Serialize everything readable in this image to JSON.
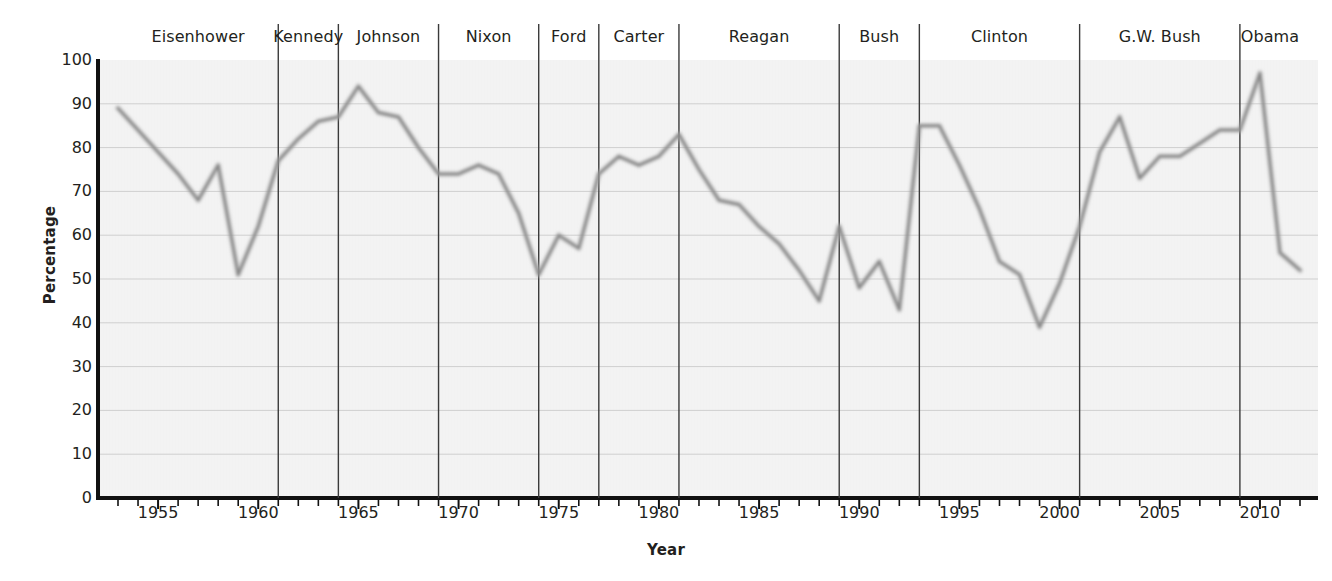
{
  "chart_data": {
    "type": "line",
    "title": "",
    "xlabel": "Year",
    "ylabel": "Percentage",
    "xlim": [
      1953,
      2012
    ],
    "ylim": [
      0,
      100
    ],
    "ytick_values": [
      0,
      10,
      20,
      30,
      40,
      50,
      60,
      70,
      80,
      90,
      100
    ],
    "ytick_labels": [
      "0",
      "10",
      "20",
      "30",
      "40",
      "50",
      "60",
      "70",
      "80",
      "90",
      "100"
    ],
    "xtick_labels": [
      "1955",
      "1960",
      "1965",
      "1970",
      "1975",
      "1980",
      "1985",
      "1990",
      "1995",
      "2000",
      "2005",
      "2010"
    ],
    "xtick_values": [
      1955,
      1960,
      1965,
      1970,
      1975,
      1980,
      1985,
      1990,
      1995,
      2000,
      2005,
      2010
    ],
    "xtick_minor_step": 1,
    "grid": "horizontal",
    "legend": "none",
    "line_color": "#8f8f8f",
    "grid_color": "#cfcfcf",
    "divider_color": "#3a3a3a",
    "plot_bg": "#f2f2f2",
    "x": [
      1953,
      1954,
      1955,
      1956,
      1957,
      1958,
      1959,
      1960,
      1961,
      1962,
      1963,
      1964,
      1965,
      1966,
      1967,
      1968,
      1969,
      1970,
      1971,
      1972,
      1973,
      1974,
      1975,
      1976,
      1977,
      1978,
      1979,
      1980,
      1981,
      1982,
      1983,
      1984,
      1985,
      1986,
      1987,
      1988,
      1989,
      1990,
      1991,
      1992,
      1993,
      1994,
      1995,
      1996,
      1997,
      1998,
      1999,
      2000,
      2001,
      2002,
      2003,
      2004,
      2005,
      2006,
      2007,
      2008,
      2009,
      2010,
      2011,
      2012
    ],
    "values": [
      89,
      84,
      79,
      74,
      68,
      76,
      51,
      62,
      77,
      82,
      86,
      87,
      94,
      88,
      87,
      80,
      74,
      74,
      76,
      74,
      65,
      51,
      60,
      57,
      74,
      78,
      76,
      78,
      83,
      75,
      68,
      67,
      62,
      58,
      52,
      45,
      62,
      48,
      54,
      43,
      85,
      85,
      76,
      66,
      54,
      51,
      39,
      49,
      62,
      79,
      87,
      73,
      78,
      78,
      81,
      84,
      84,
      97,
      56,
      52
    ],
    "dividers": [
      1961,
      1964,
      1969,
      1974,
      1977,
      1981,
      1989,
      1993,
      2001,
      2009
    ],
    "annotations": [
      {
        "label": "Eisenhower",
        "start": 1953,
        "end": 1961
      },
      {
        "label": "Kennedy",
        "start": 1961,
        "end": 1964
      },
      {
        "label": "Johnson",
        "start": 1964,
        "end": 1969
      },
      {
        "label": "Nixon",
        "start": 1969,
        "end": 1974
      },
      {
        "label": "Ford",
        "start": 1974,
        "end": 1977
      },
      {
        "label": "Carter",
        "start": 1977,
        "end": 1981
      },
      {
        "label": "Reagan",
        "start": 1981,
        "end": 1989
      },
      {
        "label": "Bush",
        "start": 1989,
        "end": 1993
      },
      {
        "label": "Clinton",
        "start": 1993,
        "end": 2001
      },
      {
        "label": "G.W. Bush",
        "start": 2001,
        "end": 2009
      },
      {
        "label": "Obama",
        "start": 2009,
        "end": 2012
      }
    ]
  }
}
